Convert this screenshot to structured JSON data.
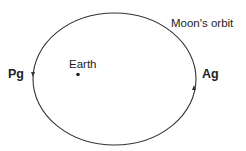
{
  "diagram": {
    "orbit_label": "Moon's orbit",
    "earth_label": "Earth",
    "perigee_label": "Pg",
    "apogee_label": "Ag",
    "colors": {
      "stroke": "#333333",
      "text": "#222222",
      "background": "#ffffff"
    }
  }
}
